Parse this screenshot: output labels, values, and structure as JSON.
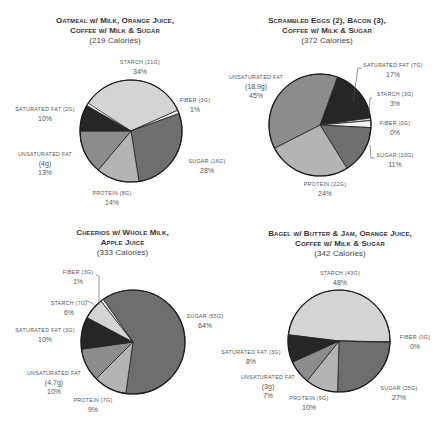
{
  "chart_data": [
    {
      "type": "pie",
      "title": "Oatmeal w/ Milk, Orange Juice, Coffee w/ Milk & Sugar",
      "title_lines": [
        "Oatmeal w/ Milk, Orange Juice,",
        "Coffee w/ Milk & Sugar"
      ],
      "subtitle": "(219 Calories)",
      "calories": 219,
      "slices": [
        {
          "name": "starch",
          "grams": "21g",
          "percent": 34,
          "color": "#d4d4d4"
        },
        {
          "name": "fiber",
          "grams": "3g",
          "percent": 1,
          "color": "#f2f2f2"
        },
        {
          "name": "sugar",
          "grams": "16g",
          "percent": 28,
          "color": "#6e6e6e"
        },
        {
          "name": "protein",
          "grams": "8g",
          "percent": 14,
          "color": "#b4b4b4"
        },
        {
          "name": "unsaturated fat",
          "grams": "4g",
          "percent": 13,
          "color": "#8c8c8c"
        },
        {
          "name": "saturated fat",
          "grams": "2g",
          "percent": 10,
          "color": "#262626"
        }
      ]
    },
    {
      "type": "pie",
      "title": "Scrambled Eggs (2), Bacon (3), Coffee w/ Milk & Sugar",
      "title_lines": [
        "Scrambled Eggs (2), Bacon (3),",
        "Coffee w/ Milk & Sugar"
      ],
      "subtitle": "(372 Calories)",
      "calories": 372,
      "slices": [
        {
          "name": "saturated fat",
          "grams": "7g",
          "percent": 17,
          "color": "#262626"
        },
        {
          "name": "starch",
          "grams": "3g",
          "percent": 3,
          "color": "#d4d4d4"
        },
        {
          "name": "fiber",
          "grams": "0g",
          "percent": 0,
          "color": "#f2f2f2"
        },
        {
          "name": "sugar",
          "grams": "10g",
          "percent": 11,
          "color": "#6e6e6e"
        },
        {
          "name": "protein",
          "grams": "22g",
          "percent": 24,
          "color": "#b4b4b4"
        },
        {
          "name": "unsaturated fat",
          "grams": "18.9g",
          "percent": 45,
          "color": "#8c8c8c"
        }
      ]
    },
    {
      "type": "pie",
      "title": "Cheerios w/ Whole Milk, Apple Juice",
      "title_lines": [
        "Cheerios w/ Whole Milk,",
        "Apple Juice"
      ],
      "subtitle": "(333 Calories)",
      "calories": 333,
      "slices": [
        {
          "name": "sugar",
          "grams": "55g",
          "percent": 64,
          "color": "#6e6e6e"
        },
        {
          "name": "protein",
          "grams": "7g",
          "percent": 9,
          "color": "#b4b4b4"
        },
        {
          "name": "unsaturated fat",
          "grams": "4.7g",
          "percent": 10,
          "color": "#8c8c8c"
        },
        {
          "name": "saturated fat",
          "grams": "3g",
          "percent": 10,
          "color": "#262626"
        },
        {
          "name": "starch",
          "grams": "7g",
          "percent": 6,
          "color": "#d4d4d4"
        },
        {
          "name": "fiber",
          "grams": "3g",
          "percent": 1,
          "color": "#f2f2f2"
        }
      ]
    },
    {
      "type": "pie",
      "title": "Bagel w/ Butter & Jam, Orange Juice, Coffee w/ Milk & Sugar",
      "title_lines": [
        "Bagel w/ Butter & Jam, Orange Juice,",
        "Coffee w/ Milk & Sugar"
      ],
      "subtitle": "(342 Calories)",
      "calories": 342,
      "slices": [
        {
          "name": "starch",
          "grams": "43g",
          "percent": 48,
          "color": "#d4d4d4"
        },
        {
          "name": "fiber",
          "grams": "0g",
          "percent": 0,
          "color": "#f2f2f2"
        },
        {
          "name": "sugar",
          "grams": "25g",
          "percent": 27,
          "color": "#6e6e6e"
        },
        {
          "name": "protein",
          "grams": "9g",
          "percent": 10,
          "color": "#b4b4b4"
        },
        {
          "name": "unsaturated fat",
          "grams": "3g",
          "percent": 7,
          "color": "#8c8c8c"
        },
        {
          "name": "saturated fat",
          "grams": "3g",
          "percent": 8,
          "color": "#262626"
        }
      ]
    }
  ],
  "labels": {
    "p0": {
      "starch": {
        "name": "starch (21g)",
        "pct": "34%"
      },
      "fiber": {
        "name": "fiber (3g)",
        "pct": "1%"
      },
      "sugar": {
        "name": "sugar (16g)",
        "pct": "28%"
      },
      "protein": {
        "name": "protein (8g)",
        "pct": "14%"
      },
      "unsat": {
        "name": "unsaturated fat",
        "g": "(4g)",
        "pct": "13%"
      },
      "sat": {
        "name": "saturated fat (2g)",
        "pct": "10%"
      }
    },
    "p1": {
      "sat": {
        "name": "saturated fat (7g)",
        "pct": "17%"
      },
      "starch": {
        "name": "starch (3g)",
        "pct": "3%"
      },
      "fiber": {
        "name": "fiber (0g)",
        "pct": "0%"
      },
      "sugar": {
        "name": "sugar (10g)",
        "pct": "11%"
      },
      "protein": {
        "name": "protein (22g)",
        "pct": "24%"
      },
      "unsat": {
        "name": "unsaturated fat",
        "g": "(18.9g)",
        "pct": "45%"
      }
    },
    "p2": {
      "fiber": {
        "name": "fiber (3g)",
        "pct": "1%"
      },
      "starch": {
        "name": "starch (7g)",
        "pct": "6%"
      },
      "sat": {
        "name": "saturated fat (3g)",
        "pct": "10%"
      },
      "unsat": {
        "name": "unsaturated fat",
        "g": "(4.7g)",
        "pct": "10%"
      },
      "protein": {
        "name": "protein (7g)",
        "pct": "9%"
      },
      "sugar": {
        "name": "sugar (55g)",
        "pct": "64%"
      }
    },
    "p3": {
      "starch": {
        "name": "starch (43g)",
        "pct": "48%"
      },
      "fiber": {
        "name": "fiber (0g)",
        "pct": "0%"
      },
      "sugar": {
        "name": "sugar (25g)",
        "pct": "27%"
      },
      "protein": {
        "name": "protein (9g)",
        "pct": "10%"
      },
      "unsat": {
        "name": "unsaturated fat",
        "g": "(3g)",
        "pct": "7%"
      },
      "sat": {
        "name": "saturated fat (3g)",
        "pct": "8%"
      }
    }
  },
  "geometry": [
    {
      "cx": 131,
      "cy": 131,
      "r": 51,
      "start": -57,
      "sweeps": [
        123,
        4,
        101,
        49,
        50,
        30
      ]
    },
    {
      "cx": 320,
      "cy": 125,
      "r": 51,
      "start": 20,
      "sweeps": [
        62,
        3,
        8,
        55,
        95,
        137
      ]
    },
    {
      "cx": 133,
      "cy": 342,
      "r": 52,
      "start": -35,
      "sweeps": [
        223,
        37,
        37,
        36,
        24,
        3
      ]
    },
    {
      "cx": 339,
      "cy": 341,
      "r": 51,
      "start": -83,
      "sweeps": [
        174,
        0.6,
        90,
        37,
        27,
        31.4
      ]
    }
  ]
}
